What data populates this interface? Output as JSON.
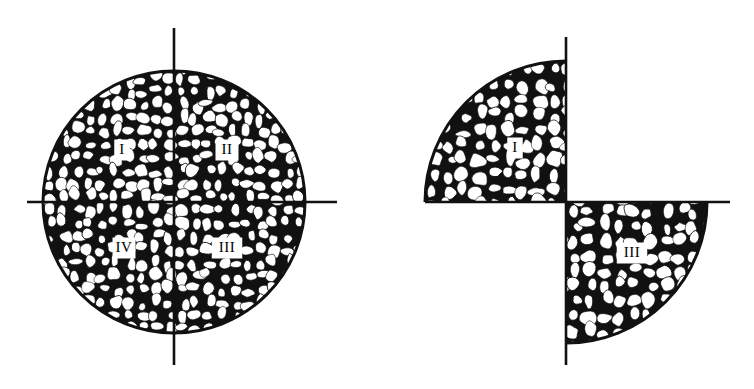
{
  "figure": {
    "type": "scientific-line-art",
    "background_color": "#ffffff",
    "ink_color": "#111111",
    "panels": [
      {
        "id": "full-section",
        "name": "full-circular-section",
        "shape": "circle",
        "center": {
          "x": 174,
          "y": 202
        },
        "radius": 131,
        "axes": {
          "vertical": {
            "x": 174,
            "y1": 28,
            "y2": 365
          },
          "horizontal": {
            "y": 202,
            "x1": 27,
            "x2": 337
          }
        },
        "quadrants": [
          {
            "id": "q1",
            "label": "I",
            "position": "upper-left",
            "label_x": 122,
            "label_y": 150,
            "textured": true
          },
          {
            "id": "q2",
            "label": "II",
            "position": "upper-right",
            "label_x": 227,
            "label_y": 150,
            "textured": true
          },
          {
            "id": "q3",
            "label": "III",
            "position": "lower-right",
            "label_x": 227,
            "label_y": 248,
            "textured": true
          },
          {
            "id": "q4",
            "label": "IV",
            "position": "lower-left",
            "label_x": 124,
            "label_y": 248,
            "textured": true
          }
        ]
      },
      {
        "id": "pinwheel-section",
        "name": "opposite-quadrant-sample",
        "shape": "two-opposite-quadrants",
        "center": {
          "x": 186,
          "y": 202
        },
        "radius": 141,
        "axes": {
          "vertical_upper": {
            "x": 186,
            "y1": 37,
            "y2": 202
          },
          "vertical_lower": {
            "x": 186,
            "y1": 202,
            "y2": 365
          },
          "horizontal_left": {
            "y": 202,
            "x1": 45,
            "x2": 186
          },
          "horizontal_right": {
            "y": 202,
            "x1": 186,
            "x2": 350
          }
        },
        "quadrants": [
          {
            "id": "q1",
            "label": "I",
            "position": "upper-left",
            "label_x": 135,
            "label_y": 148,
            "textured": true
          },
          {
            "id": "q2",
            "label": "",
            "position": "upper-right",
            "textured": false
          },
          {
            "id": "q3",
            "label": "III",
            "position": "lower-right",
            "label_x": 252,
            "label_y": 253,
            "textured": true
          },
          {
            "id": "q4",
            "label": "",
            "position": "lower-left",
            "textured": false
          }
        ]
      }
    ]
  },
  "labels": {
    "roman_one": "I",
    "roman_two": "II",
    "roman_three": "III",
    "roman_four": "IV"
  }
}
